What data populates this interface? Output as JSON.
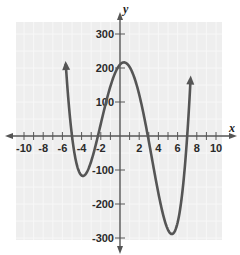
{
  "chart_data": {
    "type": "line",
    "title": "",
    "xlabel": "x",
    "ylabel": "y",
    "xlim": [
      -11,
      11
    ],
    "ylim": [
      -340,
      340
    ],
    "grid": true,
    "x_ticks": [
      -10,
      -8,
      -6,
      -4,
      -2,
      2,
      4,
      6,
      8,
      10
    ],
    "x_tick_labels": [
      "-10",
      "-8",
      "-6",
      "-4",
      "-2",
      "2",
      "4",
      "6",
      "8",
      "10"
    ],
    "y_ticks": [
      300,
      200,
      100,
      -100,
      -200,
      -300
    ],
    "y_tick_labels": [
      "300",
      "200",
      "100",
      "-100",
      "-200",
      "-300"
    ],
    "series": [
      {
        "name": "polynomial",
        "description": "quartic curve with arrows at both ends",
        "roots": [
          -5,
          -2.3,
          2.9,
          7
        ],
        "leading_coefficient": 0.9,
        "x_range": [
          -5.65,
          7.35
        ],
        "key_points": [
          {
            "x": -3.7,
            "y": -160,
            "label": "local minimum"
          },
          {
            "x": 0.6,
            "y": 220,
            "label": "local maximum"
          },
          {
            "x": 5.3,
            "y": -295,
            "label": "local minimum"
          }
        ],
        "color": "#555555"
      }
    ]
  },
  "colors": {
    "plot_background": "#eeeeee",
    "grid": "#f7f7f7",
    "axis": "#555555",
    "curve": "#555555"
  }
}
